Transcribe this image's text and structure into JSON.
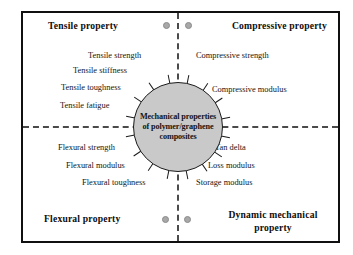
{
  "figure": {
    "center_hub": {
      "text": "Mechanical properties of polymer/graphene composites",
      "fill_color": "#c9c9c9",
      "stroke_color": "#1b1b1b",
      "spoke_count": 16
    },
    "frame_color": "#101010",
    "divider_style": "dashed",
    "divider_color": "#4a4a4a",
    "marker_dot_color": "#a8a8a8"
  },
  "quadrants": {
    "top_left": {
      "title": "Tensile property",
      "items": [
        "Tensile strength",
        "Tensile stiffness",
        "Tensile toughness",
        "Tensile fatigue"
      ]
    },
    "top_right": {
      "title": "Compressive property",
      "items": [
        "Compressive strength",
        "Compressive modulus"
      ]
    },
    "bottom_left": {
      "title": "Flexural property",
      "items": [
        "Flexural strength",
        "Flexural modulus",
        "Flexural  toughness"
      ]
    },
    "bottom_right": {
      "title": "Dynamic mechanical property",
      "items": [
        "Tan delta",
        "Loss modulus",
        "Storage modulus"
      ]
    }
  }
}
